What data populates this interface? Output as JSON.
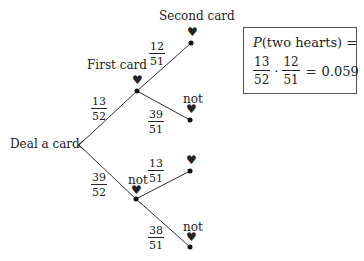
{
  "tree": {
    "root_label": "Deal a card",
    "stage_labels": {
      "first": "First card",
      "second": "Second card"
    },
    "symbol": "♥",
    "not_label": "not",
    "branches": {
      "first_heart": {
        "num": "13",
        "den": "52"
      },
      "first_not": {
        "num": "39",
        "den": "52"
      },
      "heart_heart": {
        "num": "12",
        "den": "51"
      },
      "heart_not": {
        "num": "39",
        "den": "51"
      },
      "not_heart": {
        "num": "13",
        "den": "51"
      },
      "not_not": {
        "num": "38",
        "den": "51"
      }
    }
  },
  "result_box": {
    "title": "P(two hearts) =",
    "p": "P",
    "paren": "(two hearts) =",
    "f1": {
      "num": "13",
      "den": "52"
    },
    "times": "·",
    "f2": {
      "num": "12",
      "den": "51"
    },
    "equals": "=",
    "value": "0.059"
  }
}
